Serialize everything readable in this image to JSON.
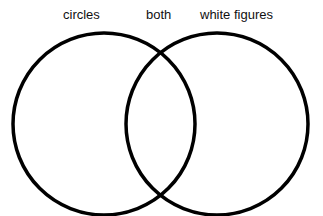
{
  "diagram": {
    "type": "venn",
    "labels": {
      "left": "circles",
      "middle": "both",
      "right": "white figures"
    },
    "circles": [
      {
        "name": "circles",
        "cx": 104,
        "cy": 124,
        "r": 91
      },
      {
        "name": "white figures",
        "cx": 217,
        "cy": 124,
        "r": 91
      }
    ],
    "stroke_color": "#000000",
    "background": "#ffffff"
  }
}
